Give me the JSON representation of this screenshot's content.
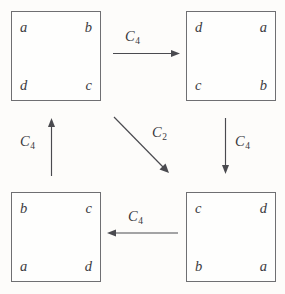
{
  "diagram": {
    "type": "cayley-diagram",
    "background_color": "#fdfcfa",
    "line_color": "#4a4a4f",
    "text_color": "#3b3b40",
    "squares": [
      {
        "id": "square-top-left",
        "position": "top-left",
        "corners": {
          "top_left": "a",
          "top_right": "b",
          "bottom_left": "d",
          "bottom_right": "c"
        }
      },
      {
        "id": "square-top-right",
        "position": "top-right",
        "corners": {
          "top_left": "d",
          "top_right": "a",
          "bottom_left": "c",
          "bottom_right": "b"
        }
      },
      {
        "id": "square-bottom-left",
        "position": "bottom-left",
        "corners": {
          "top_left": "b",
          "top_right": "c",
          "bottom_left": "a",
          "bottom_right": "d"
        }
      },
      {
        "id": "square-bottom-right",
        "position": "bottom-right",
        "corners": {
          "top_left": "c",
          "top_right": "d",
          "bottom_left": "b",
          "bottom_right": "a"
        }
      }
    ],
    "arrows": [
      {
        "id": "arrow-top",
        "label_base": "C",
        "label_sub": "4",
        "direction": "right",
        "from": "square-top-left",
        "to": "square-top-right"
      },
      {
        "id": "arrow-right",
        "label_base": "C",
        "label_sub": "4",
        "direction": "down",
        "from": "square-top-right",
        "to": "square-bottom-right"
      },
      {
        "id": "arrow-bottom",
        "label_base": "C",
        "label_sub": "4",
        "direction": "left",
        "from": "square-bottom-right",
        "to": "square-bottom-left"
      },
      {
        "id": "arrow-left",
        "label_base": "C",
        "label_sub": "4",
        "direction": "up",
        "from": "square-bottom-left",
        "to": "square-top-left"
      },
      {
        "id": "arrow-diagonal",
        "label_base": "C",
        "label_sub": "2",
        "direction": "down-right",
        "from": "square-top-left",
        "to": "square-bottom-right"
      }
    ]
  }
}
